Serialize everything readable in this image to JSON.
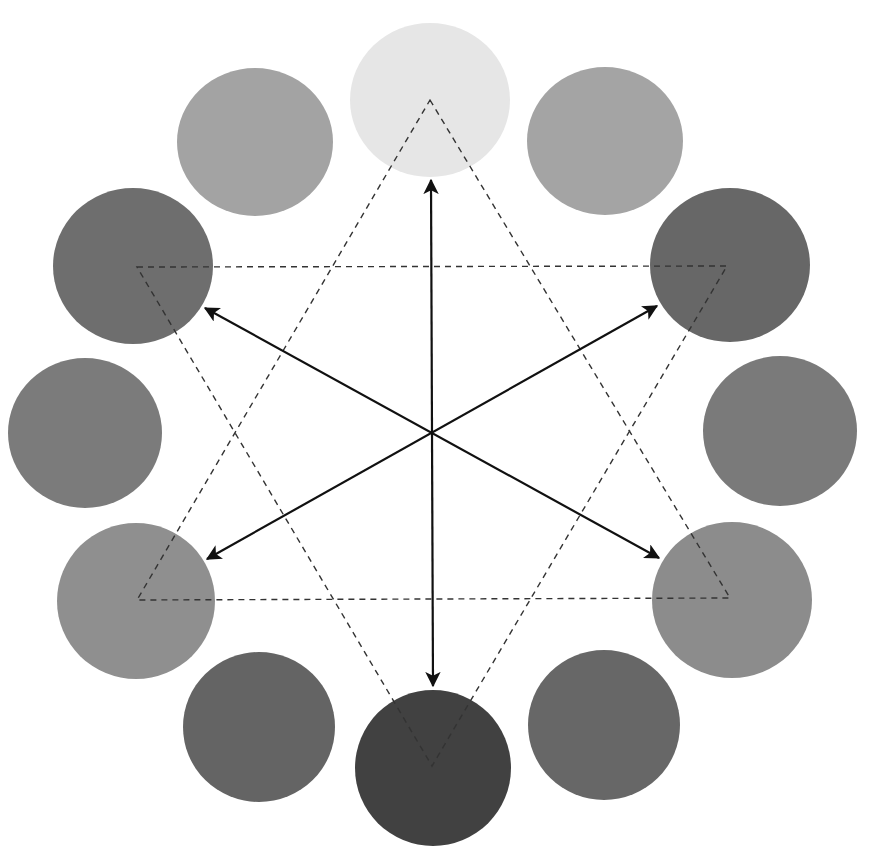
{
  "canvas": {
    "width": 880,
    "height": 852,
    "background": "#ffffff"
  },
  "center": {
    "x": 432,
    "y": 431
  },
  "circles": [
    {
      "id": "top",
      "cx": 430,
      "cy": 100,
      "rx": 80,
      "ry": 77,
      "color": "#e6e6e6"
    },
    {
      "id": "top-right",
      "cx": 605,
      "cy": 141,
      "rx": 78,
      "ry": 74,
      "color": "#a4a4a4"
    },
    {
      "id": "right-upper",
      "cx": 730,
      "cy": 265,
      "rx": 80,
      "ry": 77,
      "color": "#676767"
    },
    {
      "id": "right-middle",
      "cx": 780,
      "cy": 431,
      "rx": 77,
      "ry": 75,
      "color": "#7a7a7a"
    },
    {
      "id": "right-lower",
      "cx": 732,
      "cy": 600,
      "rx": 80,
      "ry": 78,
      "color": "#8c8c8c"
    },
    {
      "id": "bottom-right",
      "cx": 604,
      "cy": 725,
      "rx": 76,
      "ry": 75,
      "color": "#676767"
    },
    {
      "id": "bottom",
      "cx": 433,
      "cy": 768,
      "rx": 78,
      "ry": 78,
      "color": "#414141"
    },
    {
      "id": "bottom-left",
      "cx": 259,
      "cy": 727,
      "rx": 76,
      "ry": 75,
      "color": "#646464"
    },
    {
      "id": "left-lower",
      "cx": 136,
      "cy": 601,
      "rx": 79,
      "ry": 78,
      "color": "#8f8f8f"
    },
    {
      "id": "left-middle",
      "cx": 85,
      "cy": 433,
      "rx": 77,
      "ry": 75,
      "color": "#7b7b7b"
    },
    {
      "id": "left-upper",
      "cx": 133,
      "cy": 266,
      "rx": 80,
      "ry": 78,
      "color": "#6e6e6e"
    },
    {
      "id": "top-left",
      "cx": 255,
      "cy": 142,
      "rx": 78,
      "ry": 74,
      "color": "#a3a3a3"
    }
  ],
  "triangles": [
    {
      "id": "upward-triangle",
      "points": [
        [
          430,
          100
        ],
        [
          730,
          598
        ],
        [
          137,
          600
        ]
      ],
      "stroke": "#333333",
      "dash": "6,5"
    },
    {
      "id": "downward-triangle",
      "points": [
        [
          137,
          267
        ],
        [
          727,
          266
        ],
        [
          432,
          766
        ]
      ],
      "stroke": "#333333",
      "dash": "6,5"
    }
  ],
  "arrows": [
    {
      "id": "arrow-top-bottom",
      "from": [
        431,
        180
      ],
      "to": [
        433,
        686
      ],
      "double": true
    },
    {
      "id": "arrow-upperleft-lowerright",
      "from": [
        205,
        308
      ],
      "to": [
        659,
        558
      ],
      "double": true
    },
    {
      "id": "arrow-upperright-lowerleft",
      "from": [
        657,
        306
      ],
      "to": [
        207,
        559
      ],
      "double": true
    }
  ],
  "arrow_style": {
    "stroke": "#111111",
    "width": 2.2
  }
}
